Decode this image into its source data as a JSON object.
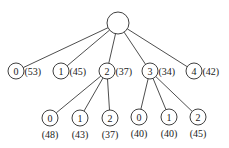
{
  "diagram": {
    "type": "tree",
    "root": {
      "x": 118,
      "y": 23,
      "r": 11,
      "label": ""
    },
    "level1": [
      {
        "label": "0",
        "cost": "(53)",
        "x": 16,
        "y": 71
      },
      {
        "label": "1",
        "cost": "(45)",
        "x": 61,
        "y": 71
      },
      {
        "label": "2",
        "cost": "(37)",
        "x": 107,
        "y": 71
      },
      {
        "label": "3",
        "cost": "(34)",
        "x": 150,
        "y": 71
      },
      {
        "label": "4",
        "cost": "(42)",
        "x": 194,
        "y": 71
      }
    ],
    "level2": [
      {
        "parent": 2,
        "label": "0",
        "cost": "(48)",
        "x": 50,
        "y": 118
      },
      {
        "parent": 2,
        "label": "1",
        "cost": "(43)",
        "x": 80,
        "y": 118
      },
      {
        "parent": 2,
        "label": "2",
        "cost": "(37)",
        "x": 110,
        "y": 118
      },
      {
        "parent": 3,
        "label": "0",
        "cost": "(40)",
        "x": 139,
        "y": 117
      },
      {
        "parent": 3,
        "label": "1",
        "cost": "(40)",
        "x": 169,
        "y": 117
      },
      {
        "parent": 3,
        "label": "2",
        "cost": "(45)",
        "x": 198,
        "y": 117
      }
    ]
  }
}
